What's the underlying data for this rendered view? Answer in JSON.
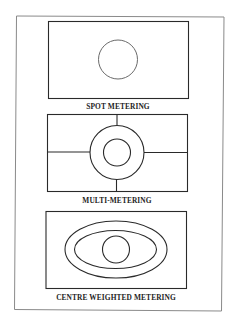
{
  "figure": {
    "panels": [
      {
        "id": "spot",
        "label": "SPOT METERING",
        "description": "Frame with a single small centre circle"
      },
      {
        "id": "multi",
        "label": "MULTI-METERING",
        "description": "Frame divided into segments with two concentric centre circles"
      },
      {
        "id": "centre-weighted",
        "label": "CENTRE WEIGHTED METERING",
        "description": "Frame with two nested ellipses and a centre circle"
      }
    ]
  },
  "colors": {
    "background": "#ffffff",
    "stroke": "#2a2a2a",
    "outer_border": "#8a8a8a"
  }
}
